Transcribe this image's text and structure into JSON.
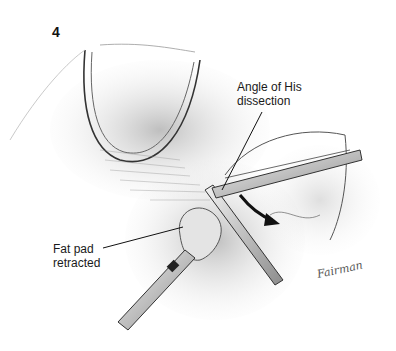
{
  "figure": {
    "number": "4",
    "labels": {
      "angle_of_his": "Angle of His\ndissection",
      "fat_pad": "Fat pad\nretracted"
    },
    "signature": "Fairman",
    "colors": {
      "ink": "#1a1a1a",
      "shade": "#9a9a9a",
      "light_shade": "#d6d6d6",
      "background": "#ffffff"
    }
  }
}
